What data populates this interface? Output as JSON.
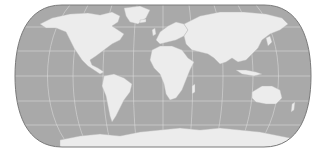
{
  "map": {
    "projection": "robinson-like pseudocylindrical world map",
    "colors": {
      "background": "#ffffff",
      "ocean": "#a9a9a9",
      "land": "#ececec",
      "graticule": "#e2e2e2",
      "outline": "#7a7a7a"
    },
    "bounds": {
      "left": 17,
      "right": 309,
      "top": 5,
      "bottom": 147
    },
    "graticule": {
      "parallels_y": [
        27,
        51,
        76,
        101,
        125
      ],
      "meridian_count": 11
    },
    "regions": [
      "north-america",
      "greenland",
      "south-america",
      "europe",
      "africa",
      "asia",
      "australia",
      "antarctica",
      "madagascar",
      "japan",
      "indonesia",
      "new-zealand",
      "uk",
      "iceland"
    ]
  }
}
